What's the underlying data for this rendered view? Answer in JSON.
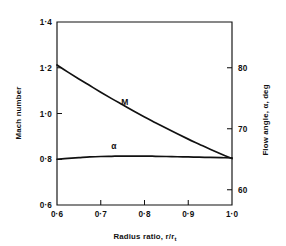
{
  "figure": {
    "background_color": "#ffffff",
    "ink_color": "#111111"
  },
  "chart_data": {
    "type": "line",
    "title": "",
    "subtitle": "",
    "xlabel": "Radius ratio,   r/r",
    "xlabel_subscript": "t",
    "ylabel_left": "Mach number",
    "ylabel_right": "Flow angle,  α,   deg",
    "xlim": [
      0.6,
      1.0
    ],
    "ylim_left": [
      0.6,
      1.4
    ],
    "ylim_right": [
      57.5,
      87.5
    ],
    "grid": false,
    "legend": "inline-curve-labels",
    "legend_position": "on-curves",
    "xticks": [
      0.6,
      0.7,
      0.8,
      0.9,
      1.0
    ],
    "xticklabels": [
      "0·6",
      "0·7",
      "0·8",
      "0·9",
      "1·0"
    ],
    "yticks_left": [
      0.6,
      0.8,
      1.0,
      1.2,
      1.4
    ],
    "yticklabels_left": [
      "0·6",
      "0·8",
      "1·0",
      "1·2",
      "1·4"
    ],
    "yticks_right": [
      60,
      70,
      80
    ],
    "yticklabels_right": [
      "60",
      "70",
      "80"
    ],
    "series": [
      {
        "name": "M",
        "label": "M",
        "axis": "left",
        "label_x": 0.755,
        "label_y": 1.035,
        "x": [
          0.6,
          0.625,
          0.65,
          0.675,
          0.7,
          0.725,
          0.75,
          0.775,
          0.8,
          0.825,
          0.85,
          0.875,
          0.9,
          0.925,
          0.95,
          0.975,
          1.0
        ],
        "values": [
          1.212,
          1.181,
          1.151,
          1.122,
          1.093,
          1.065,
          1.038,
          1.011,
          0.985,
          0.96,
          0.935,
          0.911,
          0.888,
          0.866,
          0.844,
          0.823,
          0.803
        ]
      },
      {
        "name": "alpha",
        "label": "α",
        "axis": "left",
        "label_x": 0.73,
        "label_y": 0.845,
        "x": [
          0.6,
          0.625,
          0.65,
          0.675,
          0.7,
          0.725,
          0.75,
          0.775,
          0.8,
          0.825,
          0.85,
          0.875,
          0.9,
          0.925,
          0.95,
          0.975,
          1.0
        ],
        "values": [
          0.8,
          0.804,
          0.807,
          0.81,
          0.812,
          0.813,
          0.814,
          0.814,
          0.814,
          0.813,
          0.812,
          0.811,
          0.81,
          0.809,
          0.808,
          0.807,
          0.806
        ]
      }
    ],
    "annotations": [
      {
        "text": "M",
        "x": 0.755,
        "y": 1.035
      },
      {
        "text": "α",
        "x": 0.73,
        "y": 0.845
      }
    ]
  }
}
